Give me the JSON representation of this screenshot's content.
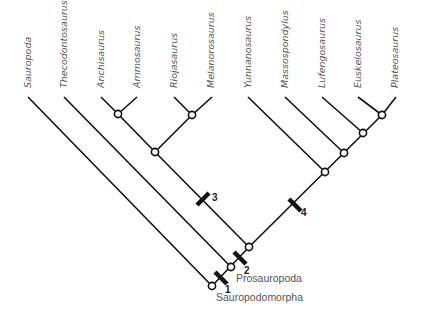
{
  "diagram": {
    "type": "cladogram",
    "taxa": [
      {
        "name": "Sauropoda",
        "x": 28
      },
      {
        "name": "Thecodontosaurus",
        "x": 64
      },
      {
        "name": "Anchisaurus",
        "x": 101
      },
      {
        "name": "Ammosaurus",
        "x": 137
      },
      {
        "name": "Riojasaurus",
        "x": 174
      },
      {
        "name": "Melanorosaurus",
        "x": 212
      },
      {
        "name": "Yunnanosaurus",
        "x": 248
      },
      {
        "name": "Massospondylus",
        "x": 285
      },
      {
        "name": "Lufengosaurus",
        "x": 322
      },
      {
        "name": "Euskelosaurus",
        "x": 358
      },
      {
        "name": "Plateosaurus",
        "x": 396
      }
    ],
    "clade_labels": {
      "prosauropoda": "Prosauropoda",
      "sauropodomorpha": "Sauropodomorpha"
    },
    "markers": [
      {
        "label": "1"
      },
      {
        "label": "2"
      },
      {
        "label": "3"
      },
      {
        "label": "4"
      }
    ],
    "colors": {
      "line": "#111111",
      "text": "#555555",
      "node_fill": "#ffffff"
    }
  }
}
